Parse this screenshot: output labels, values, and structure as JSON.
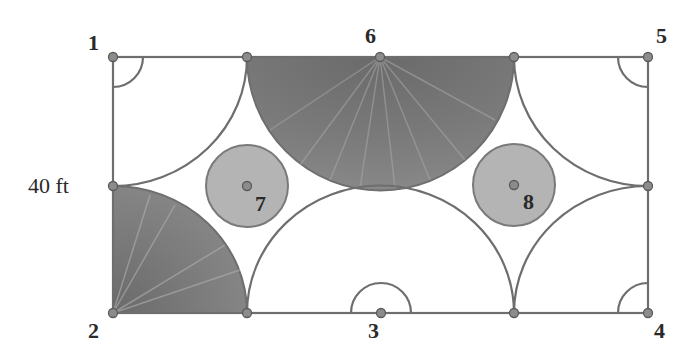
{
  "diagram": {
    "type": "geometry-region-figure",
    "dimension_label": "40 ft",
    "colors": {
      "outline": "#6e6e6e",
      "point_fill": "#8c8c8c",
      "point_stroke": "#5a5a5a",
      "shaded_dark": "#6f6f6f",
      "shaded_light": "#9a9a9a",
      "inner_circle_fill": "#b4b4b4",
      "label": "#2a2a2a",
      "background": "#ffffff"
    },
    "rectangle": {
      "x": 113,
      "y": 57,
      "width": 535,
      "height": 256
    },
    "points": [
      {
        "id": "1",
        "label": "1",
        "x": 113,
        "y": 57
      },
      {
        "id": "2",
        "label": "2",
        "x": 113,
        "y": 313
      },
      {
        "id": "3",
        "label": "3",
        "x": 381,
        "y": 313
      },
      {
        "id": "4",
        "label": "4",
        "x": 648,
        "y": 313
      },
      {
        "id": "5",
        "label": "5",
        "x": 648,
        "y": 57
      },
      {
        "id": "6",
        "label": "6",
        "x": 380,
        "y": 57
      },
      {
        "id": "7",
        "label": "7",
        "x": 247,
        "y": 186
      },
      {
        "id": "8",
        "label": "8",
        "x": 514,
        "y": 185
      }
    ],
    "labels": {
      "p1": "1",
      "p2": "2",
      "p3": "3",
      "p4": "4",
      "p5": "5",
      "p6": "6",
      "p7": "7",
      "p8": "8"
    },
    "regions": [
      {
        "name": "quarter-circle-corner-2",
        "shaded": true
      },
      {
        "name": "semicircle-top-6",
        "shaded": true
      },
      {
        "name": "semicircle-bottom-3",
        "shaded": false
      },
      {
        "name": "quarter-arc-corner-1",
        "shaded": false
      },
      {
        "name": "quarter-arc-corner-5",
        "shaded": false
      },
      {
        "name": "quarter-arc-corner-4",
        "shaded": false
      },
      {
        "name": "circle-7",
        "shaded": true
      },
      {
        "name": "circle-8",
        "shaded": true
      }
    ]
  }
}
